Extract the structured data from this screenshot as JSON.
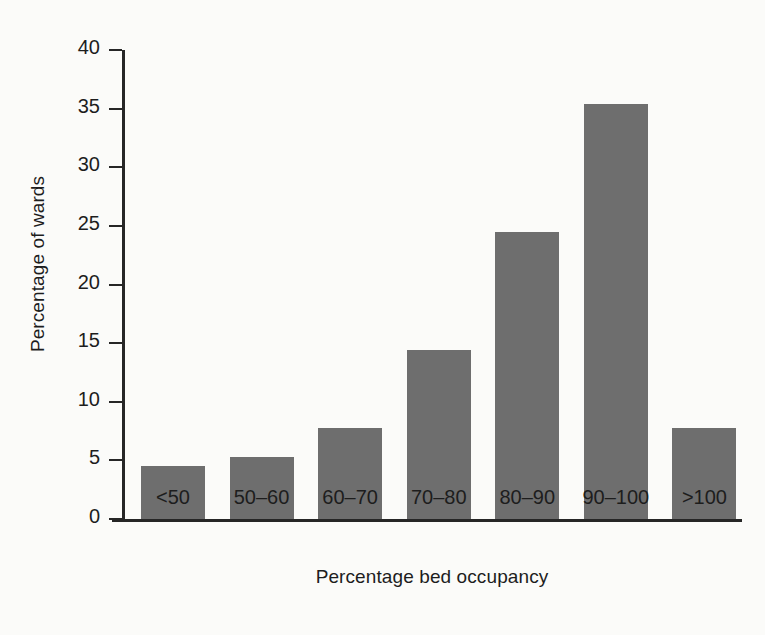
{
  "chart_data": {
    "type": "bar",
    "title": "",
    "subtitle": "",
    "xlabel": "Percentage bed occupancy",
    "ylabel": "Percentage of wards",
    "categories": [
      "<50",
      "50–60",
      "60–70",
      "70–80",
      "80–90",
      "90–100",
      ">100"
    ],
    "values": [
      4.5,
      5.3,
      7.8,
      14.4,
      24.5,
      35.4,
      7.8
    ],
    "ylim": [
      0,
      40
    ],
    "xlim": null,
    "yticks": [
      0,
      5,
      10,
      15,
      20,
      25,
      30,
      35,
      40
    ],
    "ytick_labels": [
      "0",
      "5",
      "10",
      "15",
      "20",
      "25",
      "30",
      "35",
      "40"
    ],
    "grid": false,
    "legend": null,
    "legend_position": "none",
    "annotations": [],
    "bar_color": "#6e6e6e",
    "axis_color": "#262626",
    "background_color": "#fbfbf9"
  }
}
